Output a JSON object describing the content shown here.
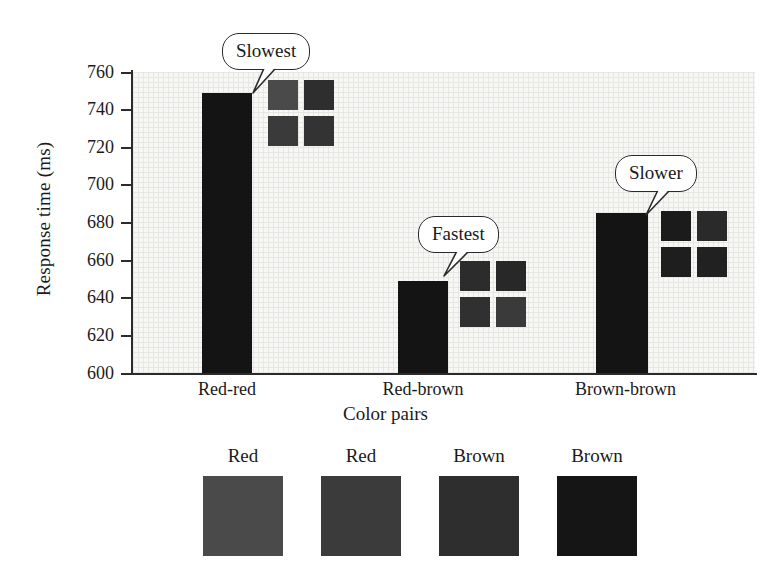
{
  "chart_data": {
    "type": "bar",
    "title": "",
    "xlabel": "Color pairs",
    "ylabel": "Response time (ms)",
    "categories": [
      "Red-red",
      "Red-brown",
      "Brown-brown"
    ],
    "values": [
      749,
      649,
      685
    ],
    "ylim": [
      600,
      760
    ],
    "yticks": [
      760,
      740,
      720,
      700,
      680,
      660,
      640,
      620,
      600
    ],
    "ytick_labels": [
      "760",
      "740",
      "720",
      "700",
      "680",
      "660",
      "640",
      "620",
      "600"
    ],
    "grid": true,
    "legend_position": "below-axes",
    "bar_color": "#141414",
    "plot_background": "#f7f7f5",
    "annotations": [
      {
        "text": "Slowest",
        "target_category": "Red-red",
        "target_value": 749
      },
      {
        "text": "Fastest",
        "target_category": "Red-brown",
        "target_value": 649
      },
      {
        "text": "Slower",
        "target_category": "Brown-brown",
        "target_value": 685
      }
    ],
    "stimulus_swatches": [
      {
        "category": "Red-red",
        "cells": [
          "#4a4a4a",
          "#2e2e2e",
          "#3a3a3a",
          "#333333"
        ]
      },
      {
        "category": "Red-brown",
        "cells": [
          "#2c2c2c",
          "#282828",
          "#303030",
          "#3a3a3a"
        ]
      },
      {
        "category": "Brown-brown",
        "cells": [
          "#1b1b1b",
          "#2a2a2a",
          "#1e1e1e",
          "#212121"
        ]
      }
    ]
  },
  "yaxis": {
    "title": "Response time (ms)",
    "ticks": [
      {
        "label": "760"
      },
      {
        "label": "740"
      },
      {
        "label": "720"
      },
      {
        "label": "700"
      },
      {
        "label": "680"
      },
      {
        "label": "660"
      },
      {
        "label": "640"
      },
      {
        "label": "620"
      },
      {
        "label": "600"
      }
    ]
  },
  "xaxis": {
    "title": "Color pairs",
    "ticks": [
      {
        "label": "Red-red"
      },
      {
        "label": "Red-brown"
      },
      {
        "label": "Brown-brown"
      }
    ]
  },
  "callouts": [
    {
      "text": "Slowest"
    },
    {
      "text": "Fastest"
    },
    {
      "text": "Slower"
    }
  ],
  "legend": {
    "items": [
      {
        "label": "Red",
        "color": "#4a4a4a"
      },
      {
        "label": "Red",
        "color": "#3b3b3b"
      },
      {
        "label": "Brown",
        "color": "#2e2e2e"
      },
      {
        "label": "Brown",
        "color": "#151515"
      }
    ]
  }
}
